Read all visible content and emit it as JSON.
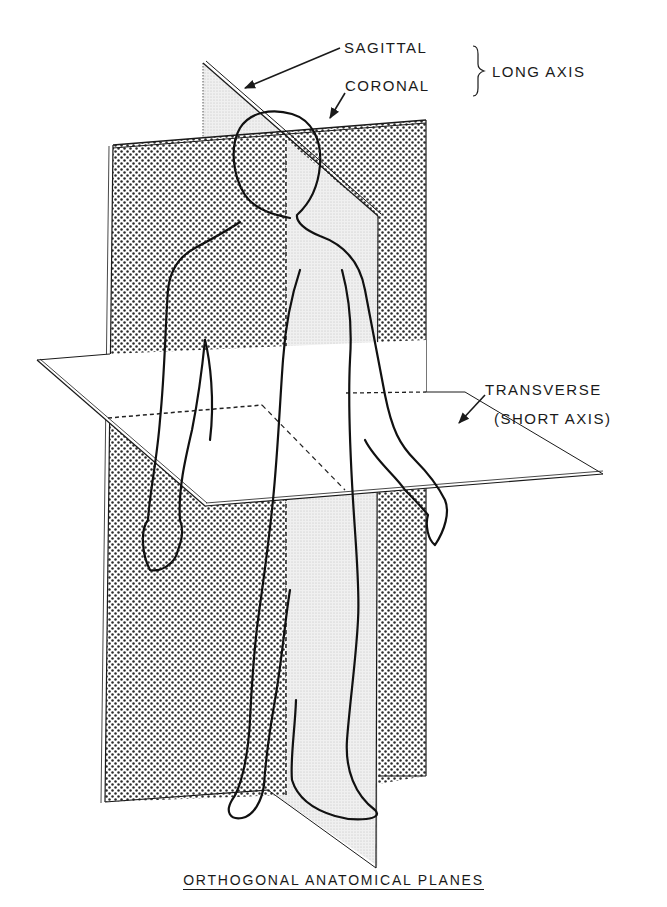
{
  "figure": {
    "title": "ORTHOGONAL ANATOMICAL PLANES",
    "labels": {
      "sagittal": "SAGITTAL",
      "coronal": "CORONAL",
      "long_axis": "LONG AXIS",
      "transverse": "TRANSVERSE",
      "short_axis": "(SHORT AXIS)"
    },
    "planes": [
      {
        "name": "Sagittal",
        "axis": "long",
        "fill": "light stipple"
      },
      {
        "name": "Coronal",
        "axis": "long",
        "fill": "dense dot stipple"
      },
      {
        "name": "Transverse",
        "axis": "short",
        "fill": "white"
      }
    ],
    "colors": {
      "ink": "#1a1a1a",
      "background": "#ffffff",
      "dot": "#2a2a2a",
      "light_stipple": "#e4e4e4"
    }
  }
}
